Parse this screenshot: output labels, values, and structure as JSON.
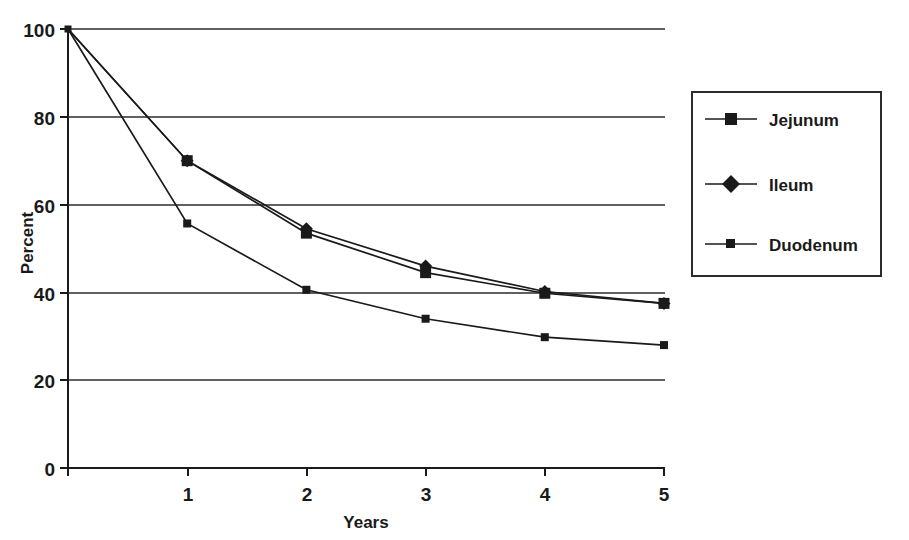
{
  "chart_data": {
    "type": "line",
    "title": "",
    "xlabel": "Years",
    "ylabel": "Percent",
    "xlim": [
      0,
      5
    ],
    "ylim": [
      0,
      100
    ],
    "x": [
      0,
      1,
      2,
      3,
      4,
      5
    ],
    "xticks": [
      "0",
      "1",
      "2",
      "3",
      "4",
      "5"
    ],
    "yticks": [
      "0",
      "20",
      "40",
      "60",
      "80",
      "100"
    ],
    "grid": "horizontal",
    "legend_position": "right",
    "series": [
      {
        "name": "Jejunum",
        "marker": "square",
        "color": "#1a1a1a",
        "values": [
          100,
          70,
          53.5,
          44.5,
          39.8,
          37.5
        ]
      },
      {
        "name": "Ileum",
        "marker": "diamond",
        "color": "#1a1a1a",
        "values": [
          100,
          70,
          54.5,
          46,
          40.2,
          37.5
        ]
      },
      {
        "name": "Duodenum",
        "marker": "small-square",
        "color": "#1a1a1a",
        "values": [
          100,
          55.7,
          40.6,
          34,
          29.8,
          28
        ]
      }
    ]
  },
  "axes": {
    "y_axis_label": "Percent",
    "x_axis_label": "Years"
  },
  "legend": {
    "entries": [
      {
        "label": "Jejunum"
      },
      {
        "label": "Ileum"
      },
      {
        "label": "Duodenum"
      }
    ]
  }
}
